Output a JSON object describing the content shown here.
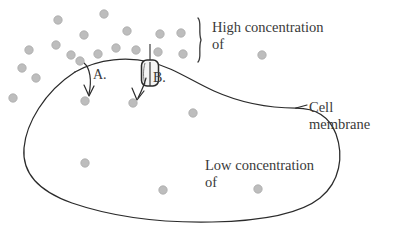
{
  "diagram": {
    "colors": {
      "stroke": "#2b2b2b",
      "particle": "#bdbdbd",
      "particle_stroke": "#ababab",
      "text": "#3a3a3a",
      "background": "#ffffff",
      "channel_fill": "#f2f2f2"
    },
    "labels": {
      "high_concentration_line1": "High concentration",
      "high_concentration_line2": "of",
      "low_concentration_line1": "Low concentration",
      "low_concentration_line2": "of",
      "cell_membrane_line1": "Cell",
      "cell_membrane_line2": "membrane",
      "arrow_a": "A.",
      "arrow_b": "B.",
      "brace": "}"
    },
    "annotations": [
      {
        "name": "brace",
        "glyph": "}",
        "x": 196,
        "y": 18,
        "height": 46
      },
      {
        "name": "leader-line-cell-membrane",
        "from_x": 296,
        "from_y": 108,
        "to_x": 308,
        "to_y": 104
      }
    ],
    "particles": {
      "radius": 4.2,
      "legend_dot_high": {
        "x": 262,
        "y": 55
      },
      "legend_dot_low": {
        "x": 258,
        "y": 189
      },
      "outside": [
        {
          "x": 58,
          "y": 20
        },
        {
          "x": 104,
          "y": 14
        },
        {
          "x": 84,
          "y": 35
        },
        {
          "x": 127,
          "y": 31
        },
        {
          "x": 160,
          "y": 34
        },
        {
          "x": 181,
          "y": 33
        },
        {
          "x": 29,
          "y": 50
        },
        {
          "x": 56,
          "y": 45
        },
        {
          "x": 71,
          "y": 55
        },
        {
          "x": 98,
          "y": 54
        },
        {
          "x": 116,
          "y": 48
        },
        {
          "x": 136,
          "y": 50
        },
        {
          "x": 158,
          "y": 52
        },
        {
          "x": 183,
          "y": 54
        },
        {
          "x": 22,
          "y": 68
        },
        {
          "x": 36,
          "y": 78
        },
        {
          "x": 80,
          "y": 61
        },
        {
          "x": 13,
          "y": 98
        }
      ],
      "inside": [
        {
          "x": 85,
          "y": 101
        },
        {
          "x": 133,
          "y": 103
        },
        {
          "x": 193,
          "y": 113
        },
        {
          "x": 85,
          "y": 163
        },
        {
          "x": 163,
          "y": 190
        }
      ]
    },
    "channel": {
      "name": "membrane-channel-protein",
      "x": 142,
      "y": 61,
      "width": 17,
      "height": 26
    },
    "arrows": [
      {
        "name": "arrow-a",
        "label": "A."
      },
      {
        "name": "arrow-b",
        "label": "B."
      }
    ]
  }
}
